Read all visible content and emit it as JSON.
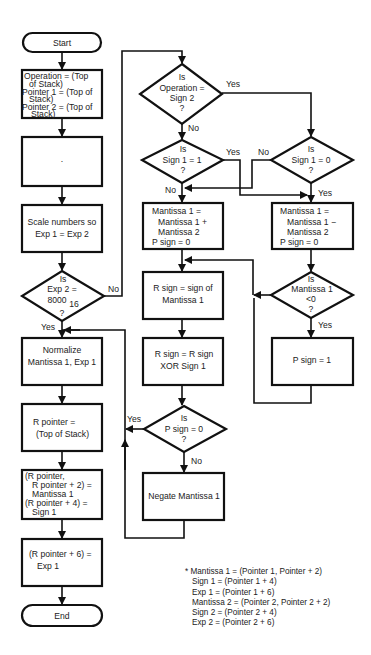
{
  "flowchart": {
    "start": "Start",
    "end": "End",
    "left_column": {
      "init": [
        "Operation = (Top",
        "of Stack)",
        "Pointer 1 = (Top of",
        "Stack)",
        "Pointer 2 = (Top of",
        "Stack)"
      ],
      "blank_box_mark": "·",
      "scale": [
        "Scale numbers so",
        "Exp 1 = Exp 2"
      ],
      "decision_exp2": [
        "Is",
        "Exp 2 =",
        "8000",
        "16",
        "?"
      ],
      "decision_exp2_no": "No",
      "decision_exp2_yes": "Yes",
      "normalize": [
        "Normalize",
        "Mantissa 1, Exp 1"
      ],
      "r_pointer": [
        "R pointer =",
        "(Top of Stack)"
      ],
      "store_mantissa": [
        "(R pointer,",
        "R pointer + 2) =",
        "Mantissa 1",
        "(R pointer + 4) =",
        "Sign 1"
      ],
      "store_exp": [
        "(R pointer + 6) =",
        "Exp 1"
      ]
    },
    "middle_column": {
      "decision_op": [
        "Is",
        "Operation =",
        "Sign 2",
        "?"
      ],
      "decision_op_yes": "Yes",
      "decision_op_no": "No",
      "decision_sign1_eq1": [
        "Is",
        "Sign 1 = 1",
        "?"
      ],
      "decision_sign1_eq1_yes": "Yes",
      "decision_sign1_eq1_no": "No",
      "add": [
        "Mantissa 1 =",
        "Mantissa 1 +",
        "Mantissa 2",
        "P sign = 0"
      ],
      "r_sign": [
        "R sign = sign of",
        "Mantissa 1"
      ],
      "xor": [
        "R sign = R sign",
        "XOR Sign 1"
      ],
      "decision_psign": [
        "Is",
        "P sign = 0",
        "?"
      ],
      "decision_psign_yes": "Yes",
      "decision_psign_no": "No",
      "negate": [
        "Negate Mantissa 1"
      ]
    },
    "right_column": {
      "decision_sign1_eq0": [
        "Is",
        "Sign 1 = 0",
        "?"
      ],
      "decision_sign1_eq0_no": "No",
      "decision_sign1_eq0_yes": "Yes",
      "subtract": [
        "Mantissa 1 =",
        "Mantissa 1 −",
        "Mantissa 2",
        "P sign = 0"
      ],
      "decision_mant_neg": [
        "Is",
        "Mantissa 1",
        "<0",
        "?"
      ],
      "decision_mant_neg_yes": "Yes",
      "psign_one": [
        "P sign = 1"
      ]
    },
    "footnote": [
      "* Mantissa 1 = (Pointer 1, Pointer + 2)",
      "Sign 1 = (Pointer 1 + 4)",
      "Exp 1 = (Pointer 1 + 6)",
      "Mantissa 2 = (Pointer 2, Pointer 2 + 2)",
      "Sign 2 = (Pointer 2 + 4)",
      "Exp 2 = (Pointer 2 + 6)"
    ]
  }
}
